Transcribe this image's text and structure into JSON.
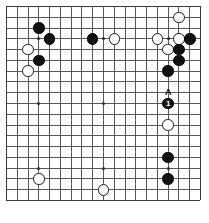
{
  "diagram": {
    "type": "go-board",
    "board_size": 19,
    "colors": {
      "background": "#ffffff",
      "grid": "#585858",
      "edge": "#3a3a3a",
      "black_stone": "#111111",
      "white_stone": "#ffffff",
      "stone_outline": "#1a1a1a",
      "label_text": "#000000",
      "stone_number_text": "#ffffff"
    },
    "geometry": {
      "origin_x": 6,
      "origin_y": 6,
      "spacing": 10.78,
      "stone_diameter": 11.5,
      "hoshi_diameter": 3
    },
    "hoshi_points": [
      {
        "col": 4,
        "row": 4
      },
      {
        "col": 10,
        "row": 4
      },
      {
        "col": 16,
        "row": 4
      },
      {
        "col": 4,
        "row": 10
      },
      {
        "col": 10,
        "row": 10
      },
      {
        "col": 16,
        "row": 10
      },
      {
        "col": 4,
        "row": 16
      },
      {
        "col": 10,
        "row": 16
      },
      {
        "col": 16,
        "row": 16
      }
    ],
    "stones": [
      {
        "col": 4,
        "row": 3,
        "color": "black",
        "label": ""
      },
      {
        "col": 5,
        "row": 4,
        "color": "black",
        "label": ""
      },
      {
        "col": 3,
        "row": 5,
        "color": "white",
        "label": ""
      },
      {
        "col": 4,
        "row": 6,
        "color": "black",
        "label": ""
      },
      {
        "col": 3,
        "row": 7,
        "color": "white",
        "label": ""
      },
      {
        "col": 9,
        "row": 4,
        "color": "black",
        "label": ""
      },
      {
        "col": 11,
        "row": 4,
        "color": "white",
        "label": ""
      },
      {
        "col": 17,
        "row": 2,
        "color": "white",
        "label": ""
      },
      {
        "col": 15,
        "row": 4,
        "color": "white",
        "label": ""
      },
      {
        "col": 17,
        "row": 4,
        "color": "white",
        "label": ""
      },
      {
        "col": 18,
        "row": 4,
        "color": "black",
        "label": ""
      },
      {
        "col": 16,
        "row": 5,
        "color": "white",
        "label": ""
      },
      {
        "col": 17,
        "row": 5,
        "color": "black",
        "label": ""
      },
      {
        "col": 17,
        "row": 6,
        "color": "black",
        "label": ""
      },
      {
        "col": 16,
        "row": 7,
        "color": "black",
        "label": ""
      },
      {
        "col": 16,
        "row": 10,
        "color": "black",
        "label": "1"
      },
      {
        "col": 16,
        "row": 12,
        "color": "white",
        "label": ""
      },
      {
        "col": 4,
        "row": 17,
        "color": "white",
        "label": ""
      },
      {
        "col": 10,
        "row": 18,
        "color": "white",
        "label": ""
      },
      {
        "col": 16,
        "row": 15,
        "color": "black",
        "label": ""
      },
      {
        "col": 16,
        "row": 17,
        "color": "black",
        "label": ""
      }
    ],
    "point_labels": [
      {
        "col": 16,
        "row": 9,
        "text": "A"
      }
    ]
  }
}
